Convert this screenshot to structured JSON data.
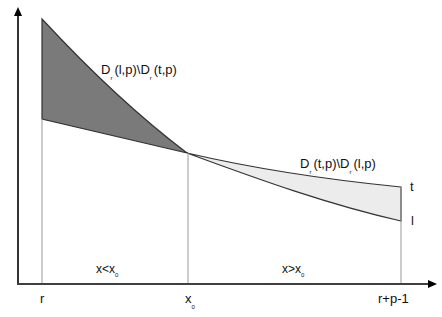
{
  "diagram": {
    "colors": {
      "dark_region": "#7a7a7a",
      "light_region": "#ececec",
      "axis": "#000000",
      "curve": "#333333",
      "guide": "#999999"
    },
    "labels": {
      "dark_region_main": "D",
      "dark_region_rest1": "(l,p)\\D",
      "dark_region_rest2": "(t,p)",
      "light_region_main": "D",
      "light_region_rest1": "(t,p)\\D",
      "light_region_rest2": "(l,p)",
      "sub_r": "r",
      "curve_t": "t",
      "curve_l": "l",
      "region_left_a": "x<x",
      "region_left_sub": "0",
      "region_right_a": "x>x",
      "region_right_sub": "0",
      "tick_r": "r",
      "tick_x0": "x",
      "tick_x0_sub": "0",
      "tick_end": "r+p-1"
    }
  }
}
